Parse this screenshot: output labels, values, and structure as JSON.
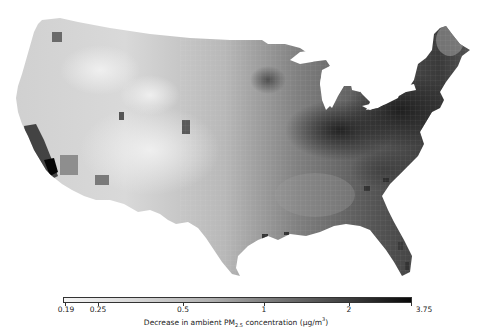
{
  "map": {
    "subject": "Contiguous United States, county-level shading",
    "variable": "Decrease in ambient PM2.5 concentration",
    "colormap": "greyscale (light = small decrease, dark = large decrease)",
    "colors": {
      "low": "#f4f4f4",
      "mid": "#b0b0b0",
      "high": "#080808",
      "background": "#ffffff"
    }
  },
  "colorbar": {
    "title_prefix": "Decrease in ambient PM",
    "title_sub": "2.5",
    "title_mid": " concentration (μg/m",
    "title_sup": "3",
    "title_suffix": ")",
    "min": 0.19,
    "max": 3.75,
    "scale": "log",
    "ticks": [
      {
        "label": "0.19",
        "x": 65
      },
      {
        "label": "0.25",
        "x": 98
      },
      {
        "label": "0.5",
        "x": 183
      },
      {
        "label": "1",
        "x": 264
      },
      {
        "label": "2",
        "x": 349
      },
      {
        "label": "3.75",
        "x": 424
      }
    ]
  }
}
